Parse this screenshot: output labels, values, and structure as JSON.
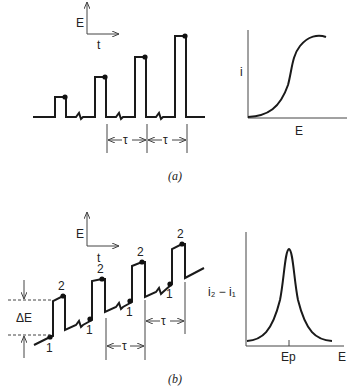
{
  "figure_a": {
    "caption": "(a)",
    "axes_inset": {
      "y_label": "E",
      "x_label": "t"
    },
    "waveform": "pulses of increasing amplitude on constant baseline",
    "period_label": "τ",
    "response_plot": {
      "y_label": "i",
      "x_label": "E",
      "shape": "sigmoidal"
    }
  },
  "figure_b": {
    "caption": "(b)",
    "axes_inset": {
      "y_label": "E",
      "x_label": "t"
    },
    "waveform": "staircase ramp with superimposed pulses",
    "sample_labels": [
      "1",
      "2"
    ],
    "pulse_height_label": "ΔE",
    "period_label": "τ",
    "response_plot": {
      "y_label": "i₂ − i₁",
      "x_label": "E",
      "peak_label": "Ep",
      "shape": "peak"
    }
  }
}
